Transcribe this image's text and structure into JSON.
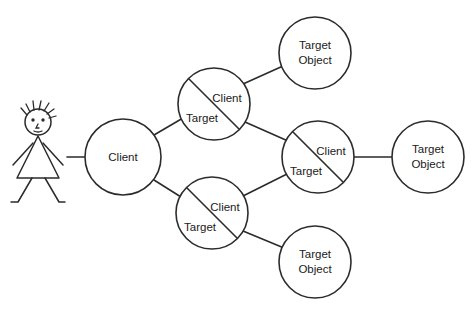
{
  "diagram": {
    "background_color": "#ffffff",
    "stroke_color": "#2b2b2b",
    "text_color": "#1a1a1a",
    "actor": {
      "name": "user-actor",
      "description": "stick figure person"
    },
    "nodes": [
      {
        "id": "client-root",
        "type": "plain",
        "label": "Client",
        "cx": 123,
        "cy": 157,
        "r": 38
      },
      {
        "id": "client-target-upper",
        "type": "split",
        "label_upper": "Client",
        "label_lower": "Target",
        "cx": 214,
        "cy": 104,
        "r": 36
      },
      {
        "id": "client-target-lower",
        "type": "split",
        "label_upper": "Client",
        "label_lower": "Target",
        "cx": 212,
        "cy": 213,
        "r": 36
      },
      {
        "id": "client-target-middle",
        "type": "split",
        "label_upper": "Client",
        "label_lower": "Target",
        "cx": 318,
        "cy": 157,
        "r": 36
      },
      {
        "id": "target-object-top",
        "type": "plain",
        "label_line1": "Target",
        "label_line2": "Object",
        "cx": 315,
        "cy": 53,
        "r": 36
      },
      {
        "id": "target-object-right",
        "type": "plain",
        "label_line1": "Target",
        "label_line2": "Object",
        "cx": 428,
        "cy": 157,
        "r": 36
      },
      {
        "id": "target-object-bottom",
        "type": "plain",
        "label_line1": "Target",
        "label_line2": "Object",
        "cx": 315,
        "cy": 262,
        "r": 36
      }
    ],
    "edges": [
      {
        "id": "edge-actor-client",
        "from": "user-actor",
        "to": "client-root"
      },
      {
        "id": "edge-client-upper",
        "from": "client-root",
        "to": "client-target-upper"
      },
      {
        "id": "edge-client-lower",
        "from": "client-root",
        "to": "client-target-lower"
      },
      {
        "id": "edge-upper-targettop",
        "from": "client-target-upper",
        "to": "target-object-top"
      },
      {
        "id": "edge-upper-middle",
        "from": "client-target-upper",
        "to": "client-target-middle"
      },
      {
        "id": "edge-lower-middle",
        "from": "client-target-lower",
        "to": "client-target-middle"
      },
      {
        "id": "edge-lower-targetbottom",
        "from": "client-target-lower",
        "to": "target-object-bottom"
      },
      {
        "id": "edge-middle-targetright",
        "from": "client-target-middle",
        "to": "target-object-right"
      }
    ]
  }
}
